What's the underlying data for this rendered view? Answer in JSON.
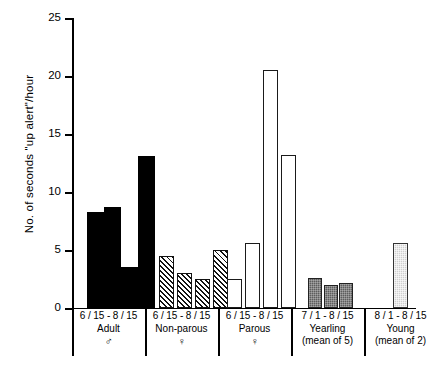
{
  "chart_data": {
    "type": "bar",
    "title": "",
    "xlabel": "",
    "ylabel": "No. of seconds \"up alert\"/hour",
    "ylim": [
      0,
      25
    ],
    "yticks": [
      0,
      5,
      10,
      15,
      20,
      25
    ],
    "grid": false,
    "legend": null,
    "groups": [
      {
        "range": "6 / 15 - 8 / 15",
        "name": "Adult",
        "symbol": "♂",
        "note": "",
        "style": "solid-black",
        "values": [
          8.3,
          8.7,
          3.5,
          13.1
        ]
      },
      {
        "range": "6 / 15 - 8 / 15",
        "name": "Non-parous",
        "symbol": "♀",
        "note": "",
        "style": "diagonal-hatch",
        "values": [
          4.5,
          3.0,
          2.5,
          5.0
        ]
      },
      {
        "range": "6 / 15 - 8 / 15",
        "name": "Parous",
        "symbol": "♀",
        "note": "",
        "style": "open-white",
        "values": [
          2.5,
          5.6,
          20.5,
          13.2
        ]
      },
      {
        "range": "7 / 1 - 8 / 15",
        "name": "Yearling",
        "symbol": "",
        "note": "(mean of 5)",
        "style": "dark-gray",
        "values": [
          2.6,
          2.0,
          2.2
        ]
      },
      {
        "range": "8 / 1 - 8 / 15",
        "name": "Young",
        "symbol": "",
        "note": "(mean of 2)",
        "style": "light-gray",
        "values": [
          5.6
        ]
      }
    ]
  },
  "axis": {
    "y_label": "No. of seconds \"up alert\"/hour",
    "tick_25": "25",
    "tick_20": "20",
    "tick_15": "15",
    "tick_10": "10",
    "tick_5": "5",
    "tick_0": "0"
  },
  "groups_text": {
    "adult": {
      "range": "6 / 15 - 8 / 15",
      "name": "Adult",
      "symbol": "♂",
      "note": ""
    },
    "nonparous": {
      "range": "6 / 15 - 8 / 15",
      "name": "Non-parous",
      "symbol": "♀",
      "note": ""
    },
    "parous": {
      "range": "6 / 15 - 8 / 15",
      "name": "Parous",
      "symbol": "♀",
      "note": ""
    },
    "yearling": {
      "range": "7 / 1 - 8 / 15",
      "name": "Yearling",
      "symbol": "",
      "note": "(mean of 5)"
    },
    "young": {
      "range": "8 / 1 - 8 / 15",
      "name": "Young",
      "symbol": "",
      "note": "(mean of 2)"
    }
  },
  "colors": {
    "solid": "#000000",
    "open": "#ffffff",
    "dark_gray": "#5d5d5d",
    "light_gray": "#cfcfcf",
    "axis": "#000000"
  }
}
